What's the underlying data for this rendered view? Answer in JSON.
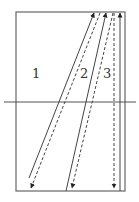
{
  "diagram": {
    "colors": {
      "stroke": "#444444",
      "frame": "#666666",
      "background": "#ffffff"
    },
    "frame": {
      "x": 16,
      "y": 12,
      "width": 109,
      "height": 179
    },
    "interface_line": {
      "x1": 4,
      "y1": 102,
      "x2": 136,
      "y2": 102
    },
    "rays": [
      {
        "id": "1",
        "label": "1",
        "label_pos": [
          32,
          78
        ],
        "solid": {
          "x1": 29,
          "y1": 178,
          "x2": 94,
          "y2": 13,
          "direction": "up"
        },
        "dashed": {
          "x1": 100,
          "y1": 13,
          "x2": 31,
          "y2": 188,
          "direction": "down"
        }
      },
      {
        "id": "2",
        "label": "2",
        "label_pos": [
          80,
          78
        ],
        "solid": {
          "x1": 66,
          "y1": 191,
          "x2": 106,
          "y2": 13,
          "direction": "up"
        },
        "dashed": {
          "x1": 113,
          "y1": 13,
          "x2": 72,
          "y2": 188,
          "direction": "down"
        }
      },
      {
        "id": "3",
        "label": "3",
        "label_pos": [
          103,
          78
        ],
        "solid": {
          "x1": 120,
          "y1": 191,
          "x2": 120,
          "y2": 13,
          "direction": "up"
        },
        "dashed": {
          "x1": 114,
          "y1": 13,
          "x2": 114,
          "y2": 188,
          "direction": "down"
        }
      }
    ]
  }
}
